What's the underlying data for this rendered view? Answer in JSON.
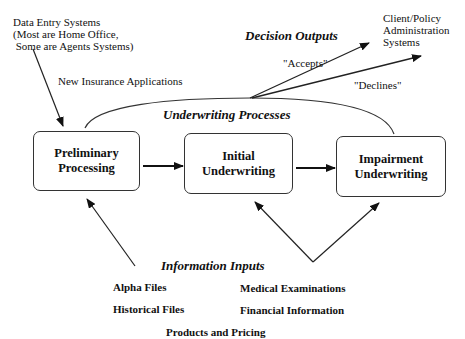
{
  "sources": {
    "data_entry": {
      "line1": "Data Entry Systems",
      "line2": "(Most are Home Office,",
      "line3": " Some are Agents Systems)"
    },
    "new_apps_label": "New Insurance Applications"
  },
  "destinations": {
    "client_policy": {
      "line1": "Client/Policy",
      "line2": "Administration",
      "line3": "Systems"
    }
  },
  "decision_outputs": {
    "heading": "Decision Outputs",
    "accepts_label": "\"Accepts\"",
    "declines_label": "\"Declines\""
  },
  "underwriting": {
    "heading": "Underwriting Processes",
    "boxes": [
      {
        "line1": "Preliminary",
        "line2": "Processing"
      },
      {
        "line1": "Initial",
        "line2": "Underwriting"
      },
      {
        "line1": "Impairment",
        "line2": "Underwriting"
      }
    ]
  },
  "information_inputs": {
    "heading": "Information Inputs",
    "items": [
      "Alpha Files",
      "Historical Files",
      "Medical Examinations",
      "Financial Information",
      "Products and Pricing"
    ]
  },
  "colors": {
    "ink": "#111111",
    "line": "#333333",
    "background": "#ffffff"
  }
}
